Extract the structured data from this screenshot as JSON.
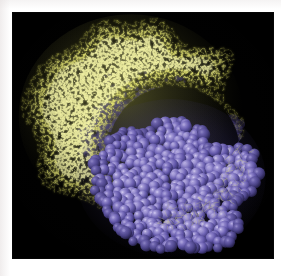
{
  "figure": {
    "kind": "molecular-graphic",
    "representation_note": "antibody-antigen complex rendering",
    "panel": {
      "background_color": "#000000",
      "left": 13,
      "top": 13,
      "width": 260,
      "height": 245
    },
    "page_background_color": "#ffffff",
    "has_text_labels": false,
    "has_axes": false,
    "has_legend": false
  },
  "molecules": [
    {
      "id": "yellow-mesh-molecule",
      "name": "wireframe-mesh-molecule",
      "style": "wireframe-dot-surface",
      "color": "#e2e273",
      "color_bright": "#f2f2a4",
      "color_dim": "#8f8f3c",
      "shape": "crescent",
      "position": "upper-left",
      "center_x": 118,
      "center_y": 103,
      "radius_x": 108,
      "radius_y": 96,
      "pocket_angle_deg": 40,
      "pocket_radius": 66,
      "description": "large C-shaped translucent mesh surface with open polygonal cells at the rim and dense bright mesh in the interior"
    },
    {
      "id": "purple-spacefill-molecule",
      "name": "spacefill-sphere-molecule",
      "style": "space-filling-cpk-spheres",
      "color": "#6055a8",
      "color_bright": "#9f95d4",
      "color_dim": "#3a3270",
      "shape": "globular",
      "position": "lower-right",
      "center_x": 158,
      "center_y": 165,
      "radius_x": 86,
      "radius_y": 68,
      "sphere_count": 420,
      "description": "compact globular cluster of overlapping shaded spheres nestled into the concave pocket of the mesh molecule"
    }
  ],
  "colors": {
    "background": "#000000",
    "page": "#ffffff",
    "mesh_yellow": "#e2e273",
    "spacefill_purple": "#6055a8",
    "occluded_purple": "#544a92"
  }
}
